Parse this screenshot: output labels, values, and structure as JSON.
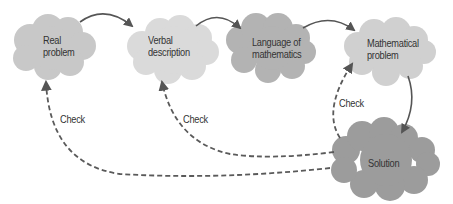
{
  "nodes": [
    {
      "id": "real",
      "line1": "Real",
      "line2": "problem",
      "fill": "#c8c8c8"
    },
    {
      "id": "verbal",
      "line1": "Verbal",
      "line2": "description",
      "fill": "#dadada"
    },
    {
      "id": "language",
      "line1": "Language of",
      "line2": "mathematics",
      "fill": "#b3b3b3"
    },
    {
      "id": "math",
      "line1": "Mathematical",
      "line2": "problem",
      "fill": "#d0d0d0"
    },
    {
      "id": "solution",
      "line1": "Solution",
      "line2": "",
      "fill": "#9c9c9c"
    }
  ],
  "edges": {
    "check_label_1": "Check",
    "check_label_2": "Check",
    "check_label_3": "Check"
  },
  "colors": {
    "arrow": "#555555",
    "dashed": "#5a5a5a",
    "text": "#333333"
  }
}
